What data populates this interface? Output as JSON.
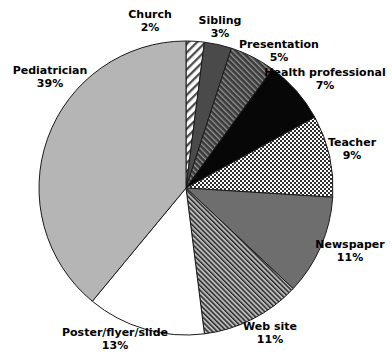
{
  "chart_data": {
    "type": "pie",
    "title": "",
    "subtitle": "",
    "xlabel": "",
    "ylabel": "",
    "legend_position": "none",
    "grid": false,
    "units": "percent",
    "start_angle_deg": 0,
    "direction": "clockwise",
    "categories": [
      "Church",
      "Sibling",
      "Presentation",
      "Health professional",
      "Teacher",
      "Newspaper",
      "Web site",
      "Poster/flyer/slide",
      "Pediatrician"
    ],
    "values": [
      2,
      3,
      5,
      7,
      9,
      11,
      11,
      13,
      39
    ],
    "value_labels": [
      "2%",
      "3%",
      "5%",
      "7%",
      "9%",
      "11%",
      "11%",
      "13%",
      "39%"
    ],
    "total": 100,
    "slices": [
      {
        "name": "Church",
        "value": 2,
        "value_label": "2%",
        "fill": "diagonal-hatch-light",
        "fill_color": "#ffffff",
        "pattern_color": "#4d4d4d",
        "stroke": "#1a1a1a"
      },
      {
        "name": "Sibling",
        "value": 3,
        "value_label": "3%",
        "fill": "solid",
        "fill_color": "#4a4a4a",
        "pattern_color": "",
        "stroke": "#1a1a1a"
      },
      {
        "name": "Presentation",
        "value": 5,
        "value_label": "5%",
        "fill": "diagonal-hatch-dark",
        "fill_color": "#3a3a3a",
        "pattern_color": "#9a9a9a",
        "stroke": "#1a1a1a"
      },
      {
        "name": "Health professional",
        "value": 7,
        "value_label": "7%",
        "fill": "solid",
        "fill_color": "#070707",
        "pattern_color": "",
        "stroke": "#1a1a1a"
      },
      {
        "name": "Teacher",
        "value": 9,
        "value_label": "9%",
        "fill": "checkerboard",
        "fill_color": "#ffffff",
        "pattern_color": "#2e2e2e",
        "stroke": "#1a1a1a"
      },
      {
        "name": "Newspaper",
        "value": 11,
        "value_label": "11%",
        "fill": "solid",
        "fill_color": "#6e6e6e",
        "pattern_color": "",
        "stroke": "#1a1a1a"
      },
      {
        "name": "Web site",
        "value": 11,
        "value_label": "11%",
        "fill": "diagonal-hatch-fine",
        "fill_color": "#9a9a9a",
        "pattern_color": "#2e2e2e",
        "stroke": "#1a1a1a"
      },
      {
        "name": "Poster/flyer/slide",
        "value": 13,
        "value_label": "13%",
        "fill": "solid",
        "fill_color": "#ffffff",
        "pattern_color": "",
        "stroke": "#1a1a1a"
      },
      {
        "name": "Pediatrician",
        "value": 39,
        "value_label": "39%",
        "fill": "solid",
        "fill_color": "#b5b5b5",
        "pattern_color": "",
        "stroke": "#1a1a1a"
      }
    ]
  },
  "labels": {
    "church": {
      "name": "Church",
      "pct": "2%"
    },
    "sibling": {
      "name": "Sibling",
      "pct": "3%"
    },
    "presentation": {
      "name": "Presentation",
      "pct": "5%"
    },
    "health_professional": {
      "name": "Health professional",
      "pct": "7%"
    },
    "teacher": {
      "name": "Teacher",
      "pct": "9%"
    },
    "newspaper": {
      "name": "Newspaper",
      "pct": "11%"
    },
    "web_site": {
      "name": "Web site",
      "pct": "11%"
    },
    "poster": {
      "name": "Poster/flyer/slide",
      "pct": "13%"
    },
    "pediatrician": {
      "name": "Pediatrician",
      "pct": "39%"
    }
  }
}
